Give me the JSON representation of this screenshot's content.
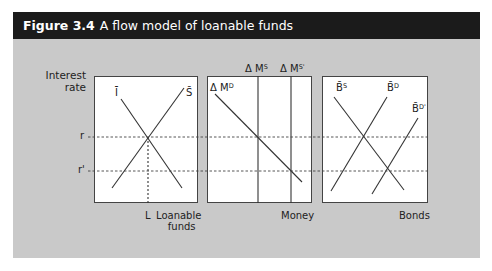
{
  "figure": {
    "number": "Figure 3.4",
    "title": "A flow model of loanable funds"
  },
  "axis": {
    "y_label_line1": "Interest",
    "y_label_line2": "rate",
    "r": "r",
    "r_prime": "r'"
  },
  "panels": {
    "loanable_funds": {
      "curve_investment": "Ī",
      "curve_saving": "S̄",
      "equilibrium_label": "L",
      "x_label_line1": "Loanable",
      "x_label_line2": "funds"
    },
    "money": {
      "demand_base": "Δ M",
      "demand_sup": "D",
      "supply_base": "Δ M",
      "supply_sup": "S",
      "supply2_base": "Δ M",
      "supply2_sup": "S'",
      "x_label": "Money"
    },
    "bonds": {
      "supply_base": "B̄",
      "supply_sup": "S",
      "demand_base": "B̄",
      "demand_sup": "D",
      "demand2_base": "B̄",
      "demand2_sup": "D'",
      "x_label": "Bonds"
    }
  },
  "colors": {
    "header_bg": "#1b1b1b",
    "body_bg": "#c9c9c9",
    "line": "#333333"
  }
}
